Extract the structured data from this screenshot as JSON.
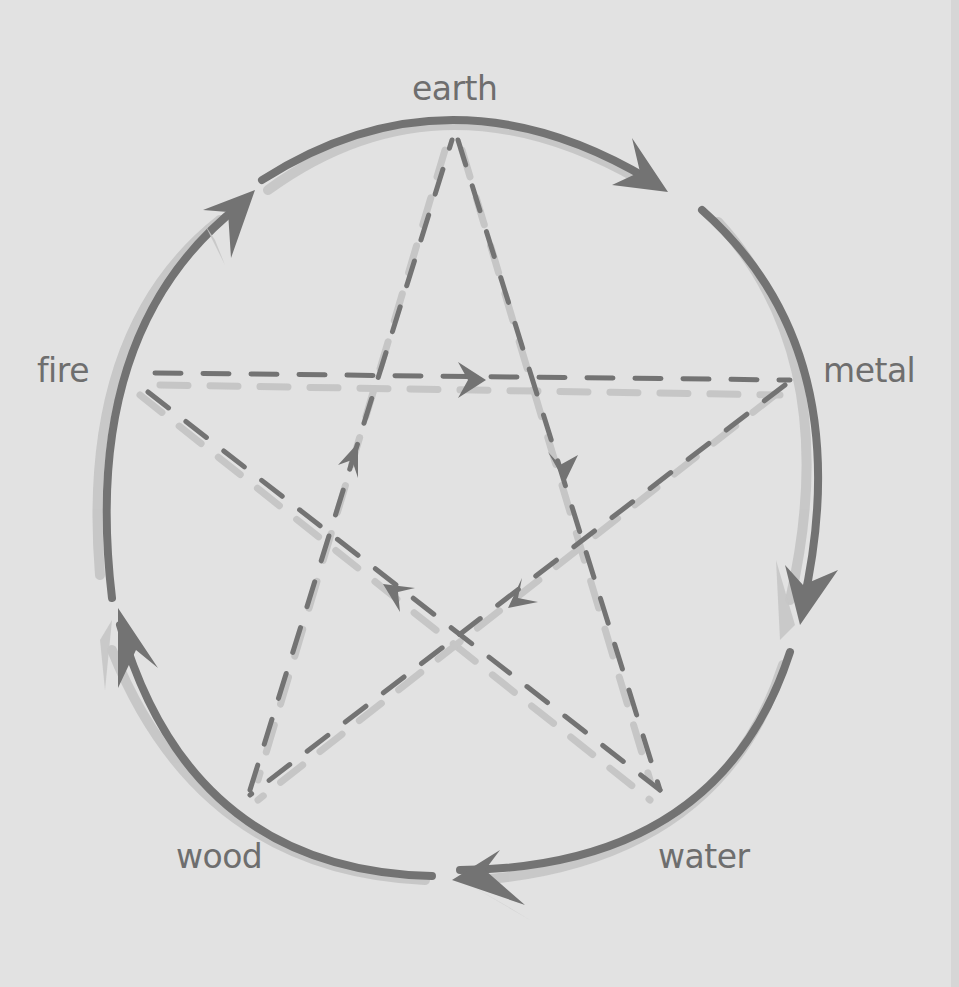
{
  "diagram": {
    "title": "",
    "colors": {
      "background": "#e2e2e2",
      "ink": "#737373",
      "shadow": "#c6c6c6",
      "label": "#6e6e6e"
    },
    "elements": [
      {
        "id": "earth",
        "label": "earth",
        "x": 452,
        "y": 140
      },
      {
        "id": "metal",
        "label": "metal",
        "x": 790,
        "y": 380
      },
      {
        "id": "water",
        "label": "water",
        "x": 660,
        "y": 790
      },
      {
        "id": "wood",
        "label": "wood",
        "x": 250,
        "y": 790
      },
      {
        "id": "fire",
        "label": "fire",
        "x": 150,
        "y": 373
      }
    ],
    "generating_cycle": {
      "style": "solid-curved-arrows",
      "arrows": [
        {
          "from": "earth",
          "to": "metal"
        },
        {
          "from": "metal",
          "to": "water"
        },
        {
          "from": "water",
          "to": "wood"
        },
        {
          "from": "wood",
          "to": "fire"
        },
        {
          "from": "fire",
          "to": "earth"
        }
      ]
    },
    "controlling_cycle": {
      "style": "dashed-star-arrows",
      "arrows": [
        {
          "from": "fire",
          "to": "metal"
        },
        {
          "from": "earth",
          "to": "water"
        },
        {
          "from": "metal",
          "to": "wood"
        },
        {
          "from": "water",
          "to": "fire"
        },
        {
          "from": "wood",
          "to": "earth"
        }
      ]
    }
  }
}
